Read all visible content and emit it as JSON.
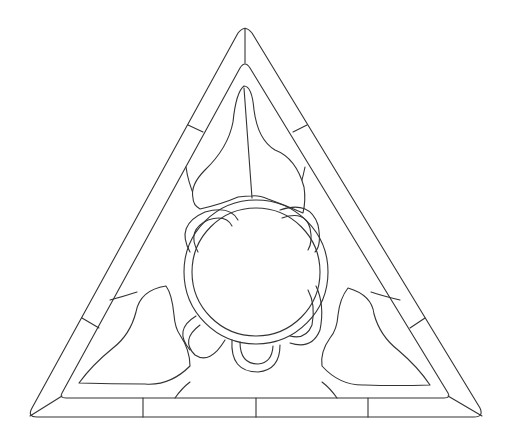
{
  "figure": {
    "title": "",
    "stroke_color": "#333333",
    "background_color": "#ffffff"
  }
}
